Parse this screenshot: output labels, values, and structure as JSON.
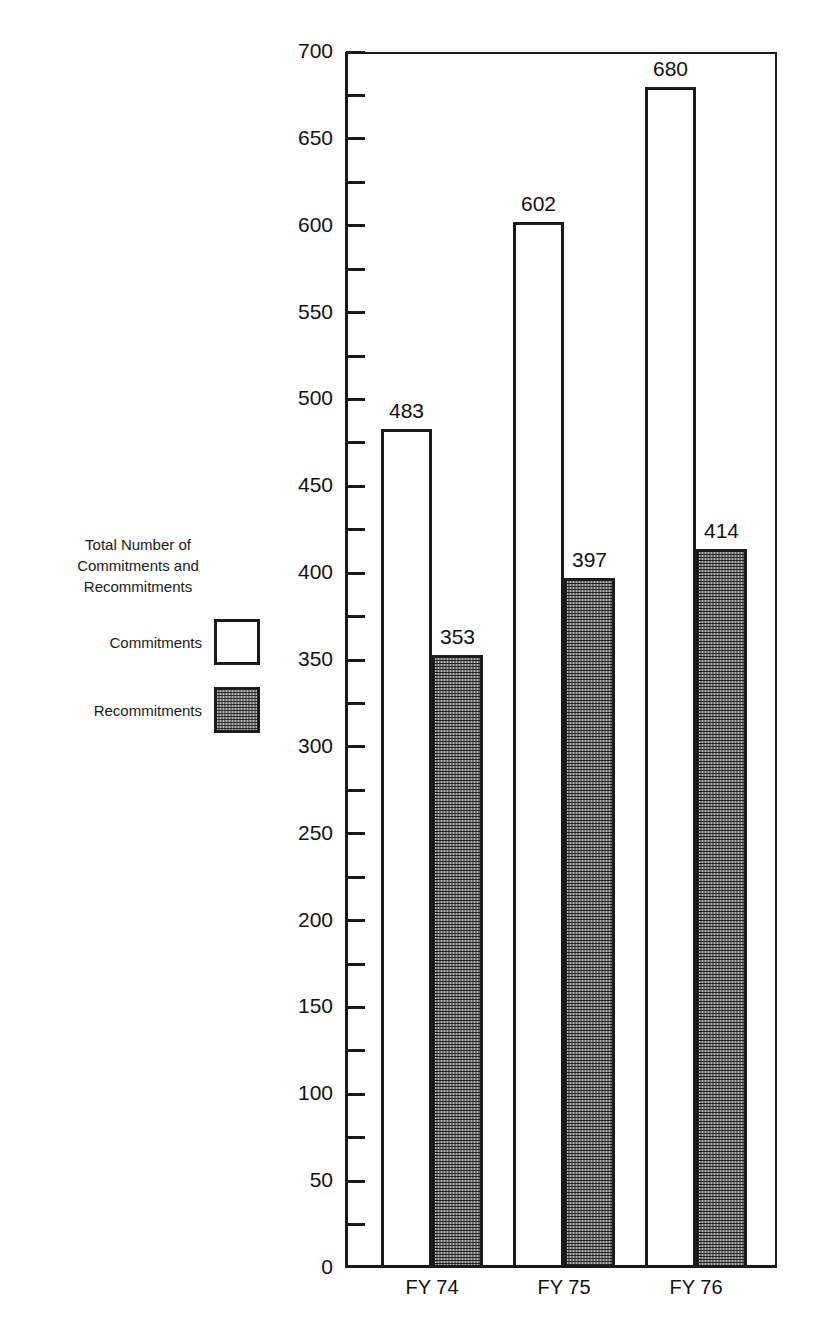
{
  "legend": {
    "title_lines": [
      "Total Number of",
      "Commitments and",
      "Recommitments"
    ],
    "items": [
      {
        "label": "Commitments",
        "swatch": "white-square-icon"
      },
      {
        "label": "Recommitments",
        "swatch": "hatched-square-icon"
      }
    ]
  },
  "chart_data": {
    "type": "bar",
    "title": "Total Number of Commitments and Recommitments",
    "xlabel": "",
    "ylabel": "",
    "categories": [
      "FY 74",
      "FY 75",
      "FY 76"
    ],
    "series": [
      {
        "name": "Commitments",
        "values": [
          483,
          602,
          680
        ]
      },
      {
        "name": "Recommitments",
        "values": [
          353,
          397,
          414
        ]
      }
    ],
    "ylim": [
      0,
      700
    ],
    "y_major_ticks": [
      0,
      50,
      100,
      150,
      200,
      250,
      300,
      350,
      400,
      450,
      500,
      550,
      600,
      650,
      700
    ],
    "y_minor_tick_interval": 25,
    "y_tick_labels": [
      "0",
      "50",
      "100",
      "150",
      "200",
      "250",
      "300",
      "350",
      "400",
      "450",
      "500",
      "550",
      "600",
      "650",
      "700"
    ],
    "grid": false,
    "legend_position": "left",
    "data_labels": [
      "483",
      "353",
      "602",
      "397",
      "680",
      "414"
    ]
  },
  "colors": {
    "axis": "#1a1a1a",
    "commitments_fill": "#ffffff",
    "recommitments_fill": "#b5b5b5",
    "text": "#111111",
    "background": "#ffffff"
  }
}
